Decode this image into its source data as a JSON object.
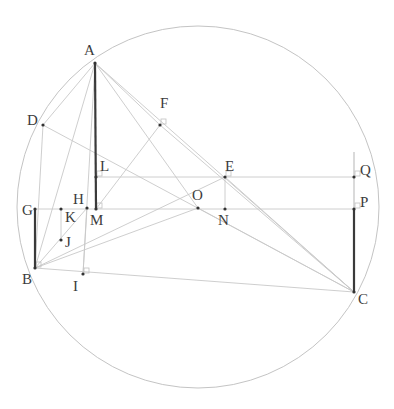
{
  "diagram": {
    "type": "geometry-construction",
    "circle": {
      "cx": 198,
      "cy": 207,
      "r": 181,
      "color": "#c4c4c4"
    },
    "points": [
      {
        "name": "A",
        "x": 95,
        "y": 63,
        "label_dx": -11,
        "label_dy": -8
      },
      {
        "name": "B",
        "x": 35,
        "y": 268,
        "label_dx": -13,
        "label_dy": 16
      },
      {
        "name": "C",
        "x": 354,
        "y": 292,
        "label_dx": 4,
        "label_dy": 12
      },
      {
        "name": "D",
        "x": 43,
        "y": 125,
        "label_dx": -16,
        "label_dy": 0
      },
      {
        "name": "E",
        "x": 225,
        "y": 177,
        "label_dx": 0,
        "label_dy": -6
      },
      {
        "name": "F",
        "x": 160,
        "y": 125,
        "label_dx": 0,
        "label_dy": -17
      },
      {
        "name": "G",
        "x": 35,
        "y": 209,
        "label_dx": -13,
        "label_dy": 6
      },
      {
        "name": "H",
        "x": 87,
        "y": 208,
        "label_dx": -14,
        "label_dy": -4
      },
      {
        "name": "I",
        "x": 83,
        "y": 274,
        "label_dx": -10,
        "label_dy": 17
      },
      {
        "name": "J",
        "x": 61,
        "y": 240,
        "label_dx": 4,
        "label_dy": 7
      },
      {
        "name": "K",
        "x": 61,
        "y": 209,
        "label_dx": 4,
        "label_dy": 13
      },
      {
        "name": "L",
        "x": 96,
        "y": 177,
        "label_dx": 4,
        "label_dy": -6
      },
      {
        "name": "M",
        "x": 96,
        "y": 209,
        "label_dx": -6,
        "label_dy": 16
      },
      {
        "name": "N",
        "x": 225,
        "y": 209,
        "label_dx": -7,
        "label_dy": 16
      },
      {
        "name": "O",
        "x": 198,
        "y": 208,
        "label_dx": -6,
        "label_dy": -8
      },
      {
        "name": "P",
        "x": 354,
        "y": 209,
        "label_dx": 6,
        "label_dy": -2
      },
      {
        "name": "Q",
        "x": 354,
        "y": 177,
        "label_dx": 6,
        "label_dy": -2
      }
    ],
    "segments_thick": [
      [
        "A",
        "M"
      ],
      [
        "G",
        "B"
      ],
      [
        "P",
        "C"
      ]
    ],
    "segments_thin": [
      [
        "A",
        "B"
      ],
      [
        "A",
        "C"
      ],
      [
        "A",
        "D"
      ],
      [
        "A",
        "I"
      ],
      [
        "A",
        "O"
      ],
      [
        "B",
        "C"
      ],
      [
        "B",
        "O"
      ],
      [
        "B",
        "E"
      ],
      [
        "B",
        "D"
      ],
      [
        "D",
        "C"
      ],
      [
        "F",
        "M"
      ],
      [
        "E",
        "C"
      ],
      [
        "O",
        "C"
      ],
      [
        "L",
        "Q"
      ],
      [
        "G",
        "P"
      ],
      [
        "E",
        "N"
      ],
      [
        "K",
        "J"
      ],
      [
        "H",
        "I"
      ],
      [
        "B",
        "H"
      ],
      [
        "A",
        "F"
      ],
      [
        "F",
        "C"
      ]
    ],
    "extra_segments": [
      {
        "x1": 354,
        "y1": 152,
        "x2": 354,
        "y2": 209
      }
    ],
    "right_angle_marks": [
      "F",
      "L",
      "M",
      "Q",
      "P",
      "E",
      "B",
      "I"
    ]
  }
}
